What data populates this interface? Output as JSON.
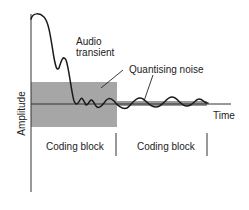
{
  "diagram": {
    "labels": {
      "audio_transient_line1": "Audio",
      "audio_transient_line2": "transient",
      "quantising_noise": "Quantising noise",
      "time_axis": "Time",
      "amplitude_axis": "Amplitude",
      "coding_block_1": "Coding block",
      "coding_block_2": "Coding block"
    },
    "colors": {
      "line": "#1a1a1a",
      "noise_fill_block1": "#a6a6a6",
      "noise_fill_block2": "#9a9a9a",
      "background": "#ffffff"
    },
    "elements": {
      "y_axis": {
        "x": 31,
        "y_top": 14,
        "y_bottom": 192
      },
      "x_axis": {
        "y": 104,
        "x_start": 31,
        "x_end": 231
      },
      "noise_region_block1": {
        "x": 31,
        "y": 82,
        "width": 86,
        "height": 45
      },
      "noise_region_block2": {
        "x": 117,
        "y": 101,
        "width": 90,
        "height": 5
      },
      "block_dividers": [
        116,
        207
      ]
    }
  }
}
